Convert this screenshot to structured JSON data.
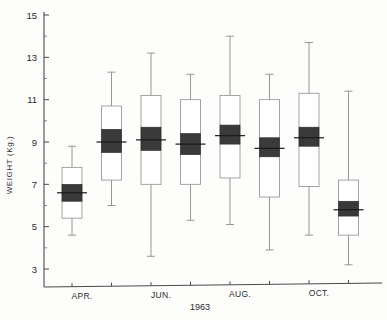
{
  "figure": {
    "background_color": "#fdfdfc",
    "ylabel": "WEIGHT (Kg.)",
    "xlabel": "1963"
  },
  "chart_data": {
    "type": "box",
    "title": "",
    "subtitle": "",
    "xlabel": "1963",
    "ylabel": "WEIGHT (Kg.)",
    "ylim": [
      3,
      15
    ],
    "y_major_ticks": [
      3,
      5,
      7,
      9,
      11,
      13,
      15
    ],
    "y_minor_ticks": [
      4,
      6,
      8,
      10,
      12,
      14
    ],
    "y_tick_labels": [
      "3",
      "5",
      "7",
      "9",
      "11",
      "13",
      "15"
    ],
    "grid": false,
    "legend": null,
    "x_axis_labels": [
      "APR.",
      "JUN.",
      "AUG.",
      "OCT."
    ],
    "x_labeled_tick_indices": [
      0,
      2,
      4,
      6
    ],
    "categories": [
      "APR.",
      "MAY",
      "JUN.",
      "JUL.",
      "AUG.",
      "SEP.",
      "OCT.",
      "NOV."
    ],
    "notation": "Mean with standard-error box (solid) inside standard-deviation box (open) and full range whiskers",
    "boxes": [
      {
        "category": "APR.",
        "mean": 6.6,
        "se_low": 6.2,
        "se_high": 7.0,
        "sd_low": 5.4,
        "sd_high": 7.8,
        "min": 4.6,
        "max": 8.8
      },
      {
        "category": "MAY",
        "mean": 9.0,
        "se_low": 8.5,
        "se_high": 9.6,
        "sd_low": 7.2,
        "sd_high": 10.7,
        "min": 6.0,
        "max": 12.3
      },
      {
        "category": "JUN.",
        "mean": 9.1,
        "se_low": 8.6,
        "se_high": 9.7,
        "sd_low": 7.0,
        "sd_high": 11.2,
        "min": 3.6,
        "max": 13.2
      },
      {
        "category": "JUL.",
        "mean": 8.9,
        "se_low": 8.4,
        "se_high": 9.4,
        "sd_low": 7.0,
        "sd_high": 11.0,
        "min": 5.3,
        "max": 12.2
      },
      {
        "category": "AUG.",
        "mean": 9.3,
        "se_low": 8.9,
        "se_high": 9.8,
        "sd_low": 7.3,
        "sd_high": 11.2,
        "min": 5.1,
        "max": 14.0
      },
      {
        "category": "SEP.",
        "mean": 8.7,
        "se_low": 8.3,
        "se_high": 9.2,
        "sd_low": 6.4,
        "sd_high": 11.0,
        "min": 3.9,
        "max": 12.2
      },
      {
        "category": "OCT.",
        "mean": 9.2,
        "se_low": 8.8,
        "se_high": 9.7,
        "sd_low": 6.9,
        "sd_high": 11.3,
        "min": 4.6,
        "max": 13.7
      },
      {
        "category": "NOV.",
        "mean": 5.8,
        "se_low": 5.5,
        "se_high": 6.2,
        "sd_low": 4.6,
        "sd_high": 7.2,
        "min": 3.2,
        "max": 11.4
      }
    ]
  }
}
